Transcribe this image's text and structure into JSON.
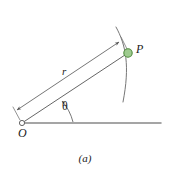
{
  "figure": {
    "caption": "(a)",
    "kind": "polar-coordinate-diagram",
    "background_color": "#ffffff",
    "line_color": "#555555",
    "text_color": "#1a1a1a",
    "labels": {
      "point_p": "P",
      "origin": "O",
      "radius": "r",
      "angle": "θ"
    },
    "elements": {
      "origin_marker": "open-circle",
      "point_marker": "filled-circle",
      "point_fill_color": "#9ecb8f",
      "point_stroke_color": "#4f8a3d",
      "baseline": "horizontal-axis",
      "radial_line": "segment-O-to-P",
      "dimension_line": "r-measure-line-with-arrowheads",
      "angle_arc": "theta-arc-with-arrowhead",
      "circular_arc": "arc-through-P"
    },
    "geometry": {
      "origin_xy": [
        22,
        123
      ],
      "point_p_xy": [
        128,
        53
      ],
      "baseline_end_x": 161,
      "angle_degrees": 33
    }
  }
}
